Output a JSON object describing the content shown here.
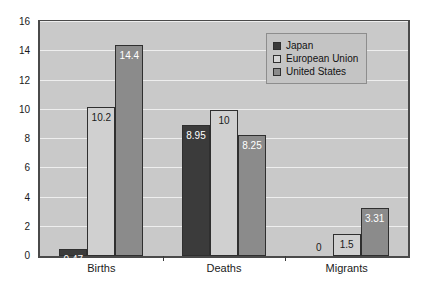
{
  "chart_data": {
    "type": "bar",
    "title": "",
    "subtitle": "",
    "xlabel": "",
    "ylabel": "",
    "categories": [
      "Births",
      "Deaths",
      "Migrants"
    ],
    "series": [
      {
        "name": "Japan",
        "color": "#3b3b3b",
        "values": [
          0.47,
          8.95,
          0
        ],
        "labels": [
          "0.47",
          "8.95",
          "0"
        ]
      },
      {
        "name": "European Union",
        "color": "#d0d0d0",
        "values": [
          10.2,
          10,
          1.5
        ],
        "labels": [
          "10.2",
          "10",
          "1.5"
        ]
      },
      {
        "name": "United States",
        "color": "#8b8b8b",
        "values": [
          14.4,
          8.25,
          3.31
        ],
        "labels": [
          "14.4",
          "8.25",
          "3.31"
        ]
      }
    ],
    "ylim": [
      0,
      16
    ],
    "ytick_step": 2,
    "yticks": [
      "0",
      "2",
      "4",
      "6",
      "8",
      "10",
      "12",
      "14",
      "16"
    ],
    "grid": true,
    "legend_position": "upper-right-inside",
    "plot_background": "#c9c9c9",
    "gridline_color": "#eeeeee",
    "frame_color": "#4a4a4a"
  },
  "legend": {
    "entries": [
      {
        "label": "Japan",
        "swatch": "s-japan"
      },
      {
        "label": "European Union",
        "swatch": "s-eu"
      },
      {
        "label": "United States",
        "swatch": "s-us"
      }
    ]
  }
}
